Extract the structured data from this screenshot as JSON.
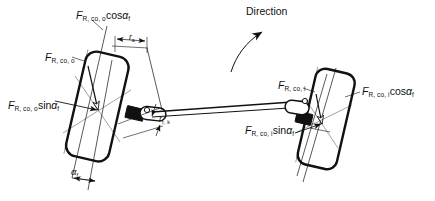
{
  "figure": {
    "type": "technical-line-drawing",
    "background_color": "#ffffff",
    "line_color": "#111111",
    "width": 435,
    "height": 201
  },
  "labels": {
    "direction": "Direction",
    "force_outer_total": {
      "base": "F",
      "sub": "R, co, o"
    },
    "force_outer_cos": {
      "base": "F",
      "sub": "R, co, o",
      "fn": "cos",
      "angle": "α",
      "angle_sub": "f"
    },
    "force_outer_sin": {
      "base": "F",
      "sub": "R, co, o",
      "fn": "sin",
      "angle": "α",
      "angle_sub": "f"
    },
    "force_inner_total": {
      "base": "F",
      "sub": "R, co, i"
    },
    "force_inner_cos": {
      "base": "F",
      "sub": "R, co, i",
      "fn": "cos",
      "angle": "α",
      "angle_sub": "f"
    },
    "force_inner_sin": {
      "base": "F",
      "sub": "R, co, i",
      "fn": "sin",
      "angle": "α",
      "angle_sub": "f"
    },
    "radius_scrub": {
      "base": "r",
      "sub": "a"
    },
    "radius_kingpin": {
      "base": "r",
      "sub": "τ, k"
    },
    "angle_kingpin": {
      "base": "α",
      "sub": "f"
    }
  }
}
